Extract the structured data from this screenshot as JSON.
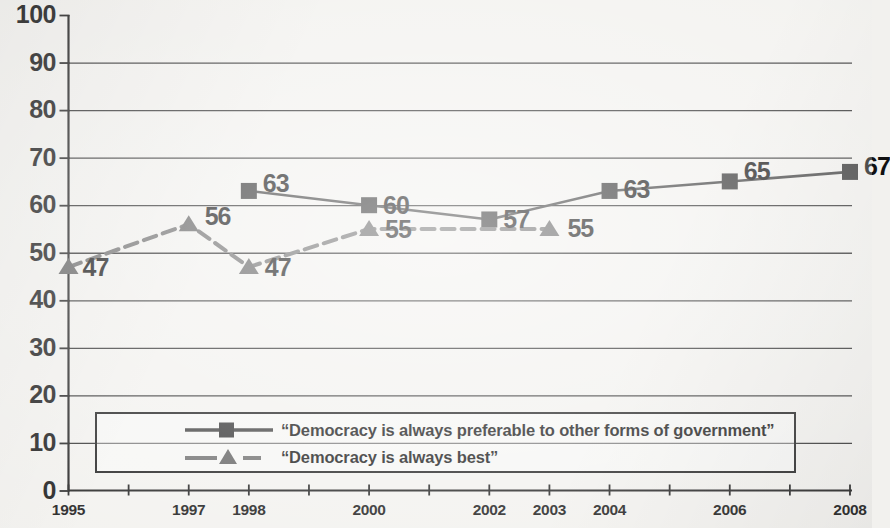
{
  "chart_data": {
    "type": "line",
    "title": "",
    "subtitle": "",
    "xlabel": "",
    "ylabel": "",
    "ylim": [
      0,
      100
    ],
    "ytick_step": 10,
    "yticks": [
      "100",
      "90",
      "80",
      "70",
      "60",
      "50",
      "40",
      "30",
      "20",
      "10",
      "0"
    ],
    "xticks": [
      "1995",
      "1996",
      "1997",
      "1998",
      "1999",
      "2000",
      "2001",
      "2002",
      "2003",
      "2004",
      "2005",
      "2006",
      "2007",
      "2008"
    ],
    "xtick_labels_shown": [
      "1995",
      "1997",
      "1998",
      "2000",
      "2002",
      "2003",
      "2004",
      "2006",
      "2008"
    ],
    "grid": "horizontal",
    "legend_position": "bottom-inside",
    "series": [
      {
        "name": "“Democracy is always preferable to other forms of government”",
        "marker": "square",
        "line_style": "solid",
        "color": "#3a3a3a",
        "x": [
          "1998",
          "2000",
          "2002",
          "2004",
          "2006",
          "2008"
        ],
        "values": [
          63,
          60,
          57,
          63,
          65,
          67
        ],
        "point_labels": [
          "63",
          "60",
          "57",
          "63",
          "65",
          "67"
        ]
      },
      {
        "name": "“Democracy is always best”",
        "marker": "triangle",
        "line_style": "dashed",
        "color": "#6b6b6b",
        "x": [
          "1995",
          "1997",
          "1998",
          "2000",
          "2003"
        ],
        "values": [
          47,
          56,
          47,
          55,
          55
        ],
        "point_labels": [
          "47",
          "56",
          "47",
          "55",
          "55"
        ]
      }
    ]
  },
  "legend": {
    "items": [
      {
        "label": "“Democracy is always preferable to other forms of government”",
        "marker": "square-marker-icon"
      },
      {
        "label": "“Democracy is always best”",
        "marker": "triangle-marker-icon"
      }
    ]
  }
}
